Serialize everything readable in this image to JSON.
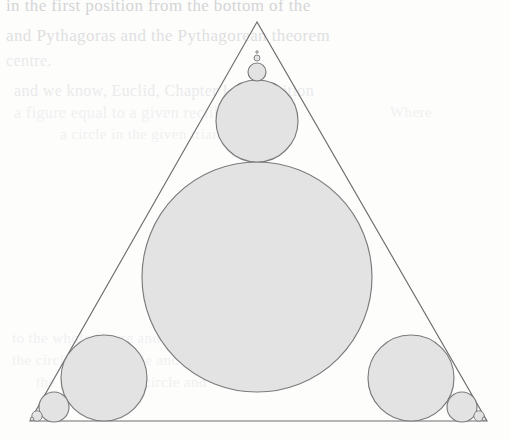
{
  "page": {
    "kind": "scanned-book-page-figure",
    "width": 509,
    "height": 440,
    "background_color": "#fdfdfc",
    "caption": ""
  },
  "figure": {
    "name": "circle-packing-in-triangle",
    "stroke_color": "#6e6e70",
    "circle_fill_color": "#e3e3e3",
    "circle_stroke_color": "#7b7b7d",
    "triangle": {
      "name": "outer-triangle",
      "apex": [
        257,
        22
      ],
      "bottom_left": [
        30,
        421
      ],
      "bottom_right": [
        487,
        421
      ]
    },
    "circles": [
      {
        "name": "incircle",
        "cx": 257,
        "cy": 277,
        "r": 115
      },
      {
        "name": "apex-circle-1",
        "cx": 257,
        "cy": 121,
        "r": 41
      },
      {
        "name": "apex-circle-2",
        "cx": 257,
        "cy": 72,
        "r": 9
      },
      {
        "name": "apex-circle-3",
        "cx": 257,
        "cy": 58,
        "r": 3.0
      },
      {
        "name": "apex-circle-4",
        "cx": 257,
        "cy": 52,
        "r": 1.2
      },
      {
        "name": "bottom-left-circle-1",
        "cx": 104,
        "cy": 378,
        "r": 43
      },
      {
        "name": "bottom-left-circle-2",
        "cx": 54,
        "cy": 407,
        "r": 15
      },
      {
        "name": "bottom-left-circle-3",
        "cx": 37,
        "cy": 416,
        "r": 5.2
      },
      {
        "name": "bottom-left-circle-4",
        "cx": 32,
        "cy": 419,
        "r": 1.8
      },
      {
        "name": "bottom-right-circle-1",
        "cx": 411,
        "cy": 378,
        "r": 43
      },
      {
        "name": "bottom-right-circle-2",
        "cx": 462,
        "cy": 407,
        "r": 15
      },
      {
        "name": "bottom-right-circle-3",
        "cx": 479,
        "cy": 416,
        "r": 5.2
      },
      {
        "name": "bottom-right-circle-4",
        "cx": 484,
        "cy": 419,
        "r": 1.8
      }
    ]
  },
  "bleed_text": {
    "note": "Illegible show-through text from the opposite side of the leaf; rendered as faint ghost lines.",
    "lines": [
      {
        "text": "in the first position from the bottom of the",
        "x": 6,
        "y": -4,
        "size": 17,
        "weight": "dark"
      },
      {
        "text": "and Pythagoras and the Pythagorean theorem",
        "x": 6,
        "y": 26,
        "size": 17,
        "weight": "normal"
      },
      {
        "text": "centre.",
        "x": 6,
        "y": 52,
        "size": 16,
        "weight": "faint"
      },
      {
        "text": "and we know, Euclid, Chapter I, proposition",
        "x": 14,
        "y": 82,
        "size": 16,
        "weight": "faint"
      },
      {
        "text": "a figure equal to a given rectilinear figure",
        "x": 14,
        "y": 104,
        "size": 16,
        "weight": "fainter"
      },
      {
        "text": "a circle in the given triangle.",
        "x": 60,
        "y": 126,
        "size": 15,
        "weight": "fainter"
      },
      {
        "text": "Where",
        "x": 390,
        "y": 104,
        "size": 15,
        "weight": "fainter"
      },
      {
        "text": "and the",
        "x": 300,
        "y": 316,
        "size": 15,
        "weight": "fainter"
      },
      {
        "text": "to the whole figure and to construct",
        "x": 12,
        "y": 330,
        "size": 15,
        "weight": "fainter"
      },
      {
        "text": "the circle in a triangle and to",
        "x": 12,
        "y": 352,
        "size": 15,
        "weight": "fainter"
      },
      {
        "text": "the centre of the circle and",
        "x": 36,
        "y": 374,
        "size": 15,
        "weight": "fainter"
      }
    ]
  }
}
